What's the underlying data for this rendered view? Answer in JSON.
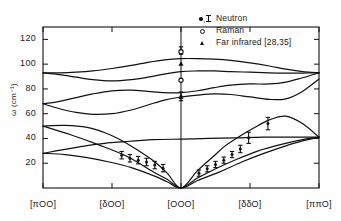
{
  "chart_data": {
    "type": "line",
    "title": "",
    "xlabel": "",
    "ylabel": "ω (cm⁻¹)",
    "ylim": [
      0,
      130
    ],
    "xlim": [
      0,
      1
    ],
    "grid": false,
    "yticks": [
      20,
      40,
      60,
      80,
      100,
      120
    ],
    "ytick_labels": [
      "20",
      "40",
      "60",
      "80",
      "100",
      "120"
    ],
    "xtick_positions": [
      0.0,
      0.25,
      0.5,
      0.75,
      1.0
    ],
    "xtick_labels": [
      "[πOO]",
      "[δOO]",
      "[OOO]",
      "[δδO]",
      "[ππO]"
    ],
    "legend_position": "top-right",
    "legend": [
      {
        "symbol": "filled-circle-with-errorbar",
        "label": "Neutron"
      },
      {
        "symbol": "open-circle",
        "label": "Raman"
      },
      {
        "symbol": "filled-triangle",
        "label": "Far infrared [28,35]"
      }
    ],
    "series": [
      {
        "name": "branch-1-upper-optic",
        "x": [
          0.0,
          0.06,
          0.12,
          0.18,
          0.25,
          0.32,
          0.38,
          0.44,
          0.5,
          0.56,
          0.62,
          0.68,
          0.75,
          0.82,
          0.88,
          0.94,
          1.0
        ],
        "y": [
          93,
          93,
          93.5,
          94.5,
          96.5,
          99,
          101.5,
          103.5,
          104.5,
          104.5,
          104,
          103,
          101,
          98.5,
          96,
          94,
          93
        ]
      },
      {
        "name": "branch-2-optic",
        "x": [
          0.0,
          0.06,
          0.12,
          0.18,
          0.25,
          0.32,
          0.38,
          0.44,
          0.5,
          0.56,
          0.62,
          0.68,
          0.75,
          0.82,
          0.88,
          0.94,
          1.0
        ],
        "y": [
          93,
          91.5,
          89.5,
          87.5,
          86.5,
          87.5,
          89.5,
          92,
          94,
          94.5,
          94.5,
          94,
          93.5,
          93,
          92.8,
          92.8,
          93
        ]
      },
      {
        "name": "branch-3-optic",
        "x": [
          0.0,
          0.06,
          0.12,
          0.18,
          0.25,
          0.32,
          0.38,
          0.44,
          0.5,
          0.56,
          0.62,
          0.68,
          0.75,
          0.82,
          0.88,
          0.94,
          1.0
        ],
        "y": [
          68,
          70,
          73,
          76,
          78.5,
          79,
          78,
          77,
          77,
          78.5,
          81,
          83,
          84,
          84,
          85.5,
          89,
          93
        ]
      },
      {
        "name": "branch-4-optic",
        "x": [
          0.0,
          0.06,
          0.12,
          0.18,
          0.25,
          0.32,
          0.38,
          0.44,
          0.5,
          0.56,
          0.62,
          0.68,
          0.75,
          0.82,
          0.88,
          0.94,
          1.0
        ],
        "y": [
          68,
          64,
          61,
          59.5,
          60,
          63,
          67,
          71,
          73.5,
          75,
          76,
          75.5,
          73.5,
          71.5,
          72,
          78,
          88
        ]
      },
      {
        "name": "branch-5-flat-optic",
        "x": [
          0.0,
          0.1,
          0.2,
          0.3,
          0.4,
          0.5,
          0.6,
          0.7,
          0.8,
          0.9,
          1.0
        ],
        "y": [
          28,
          32,
          35.5,
          37.5,
          39,
          39.5,
          40,
          40.5,
          41,
          41,
          41
        ]
      },
      {
        "name": "branch-6-acoustic-upper",
        "x": [
          0.0,
          0.08,
          0.16,
          0.22,
          0.28,
          0.34,
          0.4,
          0.45,
          0.5,
          0.56,
          0.62,
          0.66,
          0.7,
          0.76,
          0.82,
          0.88,
          0.94,
          1.0
        ],
        "y": [
          50,
          50.5,
          49,
          45,
          39,
          31,
          22,
          12,
          0,
          14,
          26,
          34,
          40,
          48,
          55,
          58,
          52,
          41
        ]
      },
      {
        "name": "branch-7-acoustic-lower",
        "x": [
          0.0,
          0.08,
          0.16,
          0.24,
          0.32,
          0.4,
          0.45,
          0.5,
          0.56,
          0.62,
          0.7,
          0.78,
          0.86,
          0.94,
          1.0
        ],
        "y": [
          28,
          27,
          24.5,
          21,
          16.5,
          10,
          5,
          0,
          8,
          15,
          23,
          30,
          35,
          39,
          41
        ]
      },
      {
        "name": "branch-8-acoustic-lowest",
        "x": [
          0.0,
          0.1,
          0.2,
          0.3,
          0.4,
          0.45,
          0.5,
          0.56,
          0.64,
          0.72,
          0.8,
          0.88,
          0.94,
          1.0
        ],
        "y": [
          50,
          43,
          35,
          26,
          13,
          7,
          0,
          6,
          13,
          21,
          28,
          34,
          38,
          41
        ]
      }
    ],
    "neutron_points": [
      {
        "x": 0.285,
        "y": 26.5,
        "err": 3.0
      },
      {
        "x": 0.315,
        "y": 24.0,
        "err": 3.0
      },
      {
        "x": 0.345,
        "y": 22.5,
        "err": 3.0
      },
      {
        "x": 0.375,
        "y": 21.0,
        "err": 3.0
      },
      {
        "x": 0.405,
        "y": 18.5,
        "err": 3.0
      },
      {
        "x": 0.435,
        "y": 16.0,
        "err": 3.0
      },
      {
        "x": 0.565,
        "y": 12.0,
        "err": 2.5
      },
      {
        "x": 0.595,
        "y": 15.5,
        "err": 2.5
      },
      {
        "x": 0.625,
        "y": 19.0,
        "err": 2.5
      },
      {
        "x": 0.655,
        "y": 22.5,
        "err": 2.5
      },
      {
        "x": 0.685,
        "y": 27.0,
        "err": 2.5
      },
      {
        "x": 0.715,
        "y": 31.5,
        "err": 3.0
      },
      {
        "x": 0.745,
        "y": 40.5,
        "err": 4.5
      },
      {
        "x": 0.815,
        "y": 52.0,
        "err": 5.0
      },
      {
        "x": 0.5,
        "y": 74.0,
        "err": 3.5
      },
      {
        "x": 0.5,
        "y": 111.0,
        "err": 3.0
      }
    ],
    "raman_points": [
      {
        "x": 0.5,
        "y": 110.0
      },
      {
        "x": 0.5,
        "y": 87.0
      }
    ],
    "far_infrared_points": [
      {
        "x": 0.5,
        "y": 100.5
      },
      {
        "x": 0.5,
        "y": 73.5
      }
    ]
  }
}
